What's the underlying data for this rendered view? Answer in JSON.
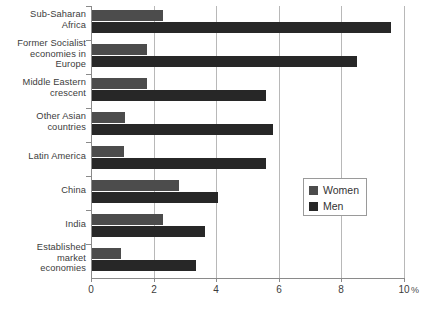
{
  "chart_data": {
    "type": "bar",
    "orientation": "horizontal",
    "title": "",
    "xlabel": "%",
    "ylabel": "",
    "xlim": [
      0,
      10
    ],
    "xticks": [
      0,
      2,
      4,
      6,
      8,
      10
    ],
    "xtick_labels": [
      "0",
      "2",
      "4",
      "6",
      "8",
      "10"
    ],
    "grid": true,
    "grid_axis": "x",
    "legend_position": "center-right",
    "categories": [
      "Sub-Saharan Africa",
      "Former Socialist economies in Europe",
      "Middle Eastern crescent",
      "Other Asian countries",
      "Latin America",
      "China",
      "India",
      "Established market economies"
    ],
    "category_label_lines": [
      [
        "Sub-Saharan",
        "Africa"
      ],
      [
        "Former Socialist",
        "economies in",
        "Europe"
      ],
      [
        "Middle Eastern",
        "crescent"
      ],
      [
        "Other Asian",
        "countries"
      ],
      [
        "Latin America"
      ],
      [
        "China"
      ],
      [
        "India"
      ],
      [
        "Established",
        "market",
        "economies"
      ]
    ],
    "series": [
      {
        "name": "Women",
        "color": "#4c4c4c",
        "values": [
          2.3,
          1.8,
          1.8,
          1.1,
          1.05,
          2.8,
          2.3,
          0.95
        ]
      },
      {
        "name": "Men",
        "color": "#272727",
        "values": [
          9.6,
          8.5,
          5.6,
          5.8,
          5.6,
          4.05,
          3.65,
          3.35
        ]
      }
    ]
  },
  "legend": {
    "entries": [
      {
        "label": "Women",
        "swatch": "women"
      },
      {
        "label": "Men",
        "swatch": "men"
      }
    ]
  },
  "axis": {
    "unit": "%"
  }
}
